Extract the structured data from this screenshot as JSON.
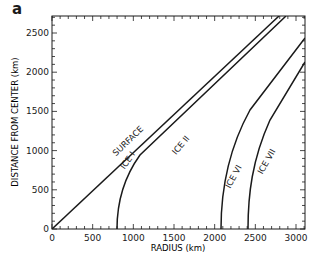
{
  "panel_label": "a",
  "chart_data": {
    "type": "line",
    "title": "",
    "xlabel": "RADIUS (km)",
    "ylabel": "DISTANCE FROM CENTER (km)",
    "xlim": [
      0,
      3100
    ],
    "ylim": [
      0,
      2720
    ],
    "xticks": [
      0,
      500,
      1000,
      1500,
      2000,
      2500,
      3000
    ],
    "yticks": [
      0,
      500,
      1000,
      1500,
      2000,
      2500
    ],
    "grid": false,
    "legend": "none (curves labeled inline)",
    "series": [
      {
        "name": "SURFACE",
        "x": [
          0,
          500,
          1000,
          1500,
          2000,
          2500,
          2720
        ],
        "y": [
          0,
          420,
          860,
          1320,
          1780,
          2380,
          2720
        ]
      },
      {
        "name": "ICE I",
        "x": [
          850,
          880,
          1000,
          1200,
          1500,
          2000,
          2500,
          2800
        ],
        "y": [
          0,
          300,
          600,
          900,
          1250,
          1800,
          2380,
          2720
        ]
      },
      {
        "name": "ICE II",
        "x": [
          850,
          880,
          1000,
          1200,
          1500,
          2000,
          2500,
          2800
        ],
        "y": [
          0,
          300,
          600,
          900,
          1250,
          1800,
          2380,
          2720
        ]
      },
      {
        "name": "ICE VI",
        "x": [
          2130,
          2140,
          2200,
          2350,
          2550,
          2800,
          3100
        ],
        "y": [
          0,
          400,
          800,
          1200,
          1600,
          2000,
          2450
        ]
      },
      {
        "name": "ICE VII",
        "x": [
          2480,
          2490,
          2550,
          2700,
          2900,
          3100
        ],
        "y": [
          0,
          400,
          800,
          1200,
          1650,
          2100
        ]
      }
    ],
    "annotations": [
      "SURFACE",
      "ICE I",
      "ICE II",
      "ICE VI",
      "ICE VII"
    ]
  },
  "labels": {
    "surface": "SURFACE",
    "ice1": "ICE I",
    "ice2": "ICE II",
    "ice6": "ICE VI",
    "ice7": "ICE VII"
  },
  "ticks": {
    "x": [
      "0",
      "500",
      "1000",
      "1500",
      "2000",
      "2500",
      "3000"
    ],
    "y": [
      "0",
      "500",
      "1000",
      "1500",
      "2000",
      "2500"
    ]
  }
}
